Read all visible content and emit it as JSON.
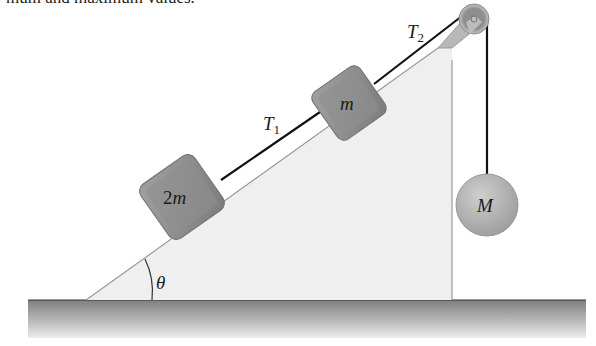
{
  "top_text": "mum and maximum values.",
  "labels": {
    "block_lower": "2m",
    "block_lower_coef": "2",
    "block_lower_var": "m",
    "block_upper": "m",
    "hanging_mass": "M",
    "tension_1_base": "T",
    "tension_1_sub": "1",
    "tension_2_base": "T",
    "tension_2_sub": "2",
    "angle": "θ"
  },
  "colors": {
    "incline_fill": "#efefef",
    "incline_edge": "#9a9a9a",
    "block_fill": "#8e8e8e",
    "rope": "#111111",
    "sphere_fill": "#b5b5b5",
    "ground_top": "#8a8a8a",
    "ground_bottom": "#e6e6e6"
  }
}
